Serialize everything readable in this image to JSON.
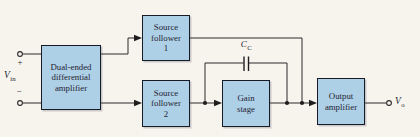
{
  "figure": {
    "background_color": "#f7f4ee",
    "wire_color": "#2b2b2b",
    "block_fill_color": "#aed0e6",
    "block_border_color": "#161b26",
    "text_color": "#1e2433"
  },
  "blocks": {
    "diff_amp": {
      "line1": "Dual-ended",
      "line2": "differential",
      "line3": "amplifier"
    },
    "source_follower_1": {
      "line1": "Source",
      "line2": "follower",
      "line3": "1"
    },
    "source_follower_2": {
      "line1": "Source",
      "line2": "follower",
      "line3": "2"
    },
    "gain_stage": {
      "line1": "Gain",
      "line2": "stage"
    },
    "output_amplifier": {
      "line1": "Output",
      "line2": "amplifier"
    }
  },
  "labels": {
    "input_polarity_plus": "+",
    "input_polarity_minus": "−",
    "input_voltage": {
      "symbol": "V",
      "subscript": "in"
    },
    "compensation_capacitor": {
      "symbol": "C",
      "subscript": "C"
    },
    "output_voltage": {
      "symbol": "V",
      "subscript": "o"
    }
  }
}
